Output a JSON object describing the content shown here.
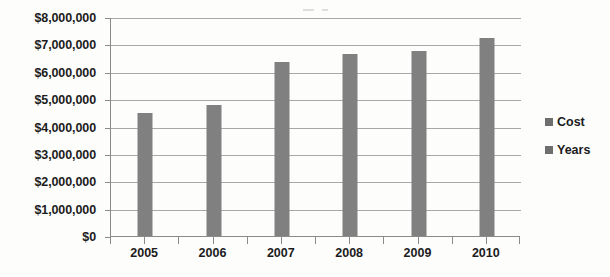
{
  "chart_data": {
    "type": "bar",
    "title": "",
    "subtitle": "",
    "xlabel": "",
    "ylabel": "",
    "categories": [
      "2005",
      "2006",
      "2007",
      "2008",
      "2009",
      "2010"
    ],
    "series": [
      {
        "name": "Cost",
        "values": [
          4500000,
          4770000,
          6350000,
          6660000,
          6760000,
          7230000
        ]
      }
    ],
    "ylim": [
      0,
      8000000
    ],
    "y_tick_values": [
      0,
      1000000,
      2000000,
      3000000,
      4000000,
      5000000,
      6000000,
      7000000,
      8000000
    ],
    "y_tick_labels": [
      "$0",
      "$1,000,000",
      "$2,000,000",
      "$3,000,000",
      "$4,000,000",
      "$5,000,000",
      "$6,000,000",
      "$7,000,000",
      "$8,000,000"
    ],
    "grid": true,
    "grid_axis": "y",
    "legend_position": "right",
    "legend": [
      {
        "label": "Cost",
        "color": "#6e6e6e"
      },
      {
        "label": "Years",
        "color": "#6e6e6e"
      }
    ],
    "bar_color": "#808080",
    "gridline_color": "#a8a8a8",
    "axis_color": "#8a8a8a",
    "text_color": "#1c1c1c",
    "background_color": "#fdfdfc"
  }
}
